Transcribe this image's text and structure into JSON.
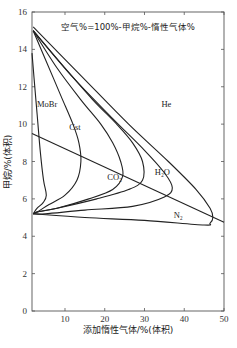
{
  "chart_data": {
    "type": "line",
    "title": "空气%=100%-甲烷%-惰性气体%",
    "xlabel": "添加惰性气体/%(体积)",
    "ylabel": "甲烷/%(体积)",
    "xlim": [
      1.7,
      50
    ],
    "ylim": [
      0,
      16
    ],
    "x_ticks": [
      10,
      20,
      30,
      40,
      50
    ],
    "y_ticks": [
      0,
      2,
      4,
      6,
      8,
      10,
      12,
      14,
      16
    ],
    "grid": false,
    "series": [
      {
        "name": "MoBr",
        "label": "MoBr",
        "points": [
          [
            1.7,
            13.8
          ],
          [
            2.2,
            12.5
          ],
          [
            3.0,
            10.5
          ],
          [
            3.8,
            8.5
          ],
          [
            4.6,
            7.0
          ],
          [
            5.3,
            6.2
          ],
          [
            4.5,
            5.8
          ],
          [
            3.0,
            5.5
          ],
          [
            2.0,
            5.2
          ]
        ]
      },
      {
        "name": "Cst",
        "label": "Cst",
        "points": [
          [
            2.0,
            15.0
          ],
          [
            5,
            13.5
          ],
          [
            9,
            11.5
          ],
          [
            12,
            10.0
          ],
          [
            13.5,
            9.0
          ],
          [
            14,
            8.0
          ],
          [
            13,
            7.0
          ],
          [
            10,
            6.2
          ],
          [
            6,
            5.7
          ],
          [
            3,
            5.3
          ],
          [
            2.0,
            5.2
          ]
        ]
      },
      {
        "name": "CO2",
        "label": "CO₂",
        "points": [
          [
            2.0,
            15.0
          ],
          [
            8,
            13.0
          ],
          [
            14,
            11.3
          ],
          [
            19,
            10.0
          ],
          [
            22,
            9.0
          ],
          [
            24,
            8.0
          ],
          [
            24.5,
            7.2
          ],
          [
            22,
            6.5
          ],
          [
            16,
            6.0
          ],
          [
            8,
            5.5
          ],
          [
            3,
            5.3
          ],
          [
            2.0,
            5.2
          ]
        ]
      },
      {
        "name": "H2O",
        "label": "H₂O",
        "points": [
          [
            2.0,
            15.0
          ],
          [
            10,
            13.0
          ],
          [
            17,
            11.3
          ],
          [
            23,
            10.0
          ],
          [
            27,
            9.0
          ],
          [
            29.5,
            8.0
          ],
          [
            29.5,
            7.0
          ],
          [
            26,
            6.5
          ],
          [
            18,
            6.0
          ],
          [
            8,
            5.5
          ],
          [
            3,
            5.3
          ],
          [
            2.0,
            5.2
          ]
        ]
      },
      {
        "name": "N2",
        "label": "N₂",
        "points": [
          [
            2.0,
            15.0
          ],
          [
            12,
            12.5
          ],
          [
            22,
            10.3
          ],
          [
            30,
            8.6
          ],
          [
            35,
            7.4
          ],
          [
            37,
            6.6
          ],
          [
            35,
            6.1
          ],
          [
            27,
            5.6
          ],
          [
            15,
            5.4
          ],
          [
            5,
            5.2
          ],
          [
            2.0,
            5.2
          ]
        ]
      },
      {
        "name": "He",
        "label": "He",
        "points": [
          [
            2.0,
            15.2
          ],
          [
            14,
            12.6
          ],
          [
            26,
            10.0
          ],
          [
            36,
            8.0
          ],
          [
            43,
            6.5
          ],
          [
            46.5,
            5.5
          ],
          [
            47.2,
            5.0
          ],
          [
            46.5,
            4.7
          ],
          [
            45,
            4.6
          ],
          [
            30,
            4.85
          ],
          [
            15,
            5.0
          ],
          [
            2.0,
            5.2
          ]
        ]
      },
      {
        "name": "air-line",
        "label": "",
        "points": [
          [
            1.7,
            9.5
          ],
          [
            50,
            4.75
          ]
        ]
      }
    ],
    "annotations": [
      {
        "text": "MoBr",
        "x": 5.5,
        "y": 10.9
      },
      {
        "text": "Cst",
        "x": 12.5,
        "y": 9.7
      },
      {
        "text": "CO₂",
        "x": 22.5,
        "y": 7.0
      },
      {
        "text": "H₂O",
        "x": 34.5,
        "y": 7.3
      },
      {
        "text": "He",
        "x": 35.5,
        "y": 10.9
      },
      {
        "text": "N₂",
        "x": 38.5,
        "y": 5.0
      }
    ]
  }
}
